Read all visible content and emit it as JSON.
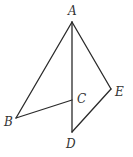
{
  "figure": {
    "width": 133,
    "height": 157,
    "background": "#ffffff",
    "line_color": "#2a2a2a",
    "label_color": "#333333",
    "points": {
      "A": {
        "label": "A",
        "x": 72,
        "y": 22
      },
      "B": {
        "label": "B",
        "x": 16,
        "y": 118
      },
      "C": {
        "label": "C",
        "x": 72,
        "y": 100
      },
      "D": {
        "label": "D",
        "x": 72,
        "y": 132
      },
      "E": {
        "label": "E",
        "x": 111,
        "y": 89
      }
    },
    "segments": [
      {
        "from": "A",
        "to": "B"
      },
      {
        "from": "B",
        "to": "C"
      },
      {
        "from": "A",
        "to": "D"
      },
      {
        "from": "A",
        "to": "E"
      },
      {
        "from": "E",
        "to": "D"
      }
    ]
  }
}
